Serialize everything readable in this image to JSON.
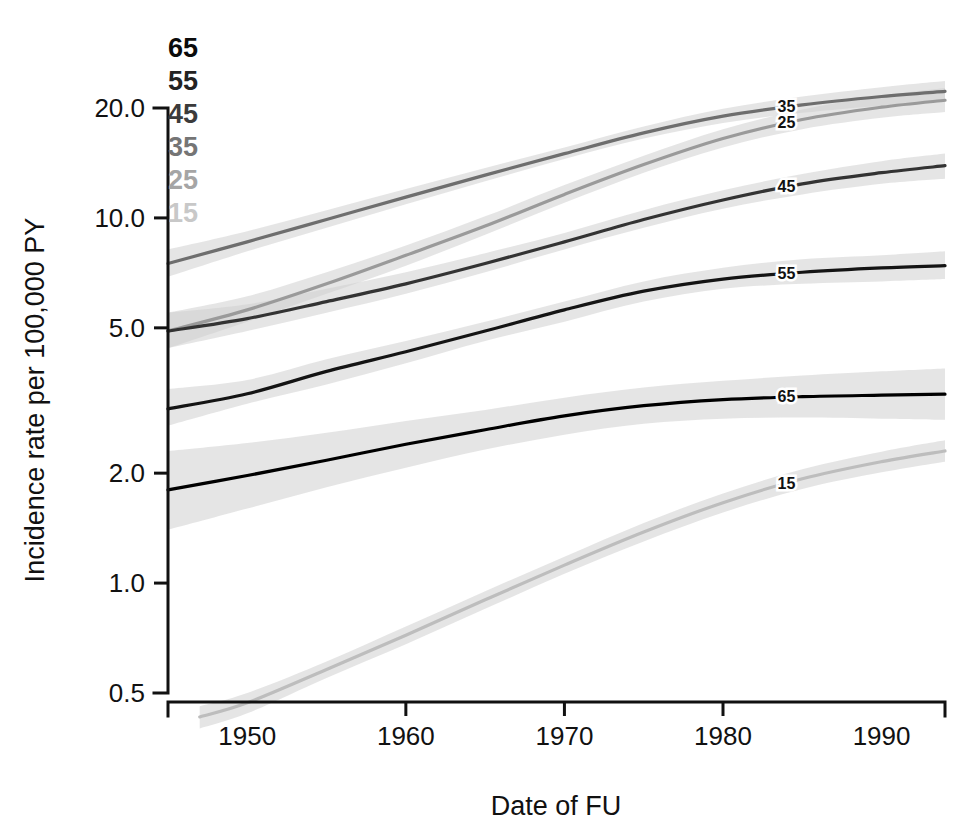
{
  "chart_data": {
    "type": "line",
    "title": "",
    "xlabel": "Date of FU",
    "ylabel": "Incidence rate per 100,000 PY",
    "yscale": "log",
    "xlim": [
      1945,
      1994
    ],
    "ylim": [
      0.45,
      24.0
    ],
    "grid": false,
    "legend_position": "top-left-inside",
    "xticks": [
      1950,
      1960,
      1970,
      1980,
      1990
    ],
    "xtick_labels": [
      "1950",
      "1960",
      "1970",
      "1980",
      "1990"
    ],
    "yticks": [
      0.5,
      1.0,
      2.0,
      5.0,
      10.0,
      20.0
    ],
    "ytick_labels": [
      "0.5",
      "1.0",
      "2.0",
      "5.0",
      "10.0",
      "20.0"
    ],
    "legend_entries": [
      "65",
      "55",
      "45",
      "35",
      "25",
      "15"
    ],
    "series": [
      {
        "name": "35",
        "label": "35",
        "color": "#6e6e6e",
        "inline_label": "35",
        "x": [
          1945,
          1950,
          1955,
          1960,
          1965,
          1970,
          1975,
          1980,
          1985,
          1990,
          1994
        ],
        "values": [
          7.5,
          8.6,
          9.9,
          11.4,
          13.1,
          15.0,
          17.1,
          19.0,
          20.4,
          21.5,
          22.2
        ],
        "ci_lower": [
          6.9,
          8.1,
          9.4,
          10.9,
          12.6,
          14.5,
          16.5,
          18.2,
          19.4,
          20.3,
          20.8
        ],
        "ci_upper": [
          8.2,
          9.2,
          10.5,
          12.0,
          13.7,
          15.6,
          17.8,
          19.9,
          21.5,
          22.8,
          23.7
        ]
      },
      {
        "name": "25",
        "label": "25",
        "color": "#9a9a9a",
        "inline_label": "25",
        "x": [
          1945,
          1950,
          1955,
          1960,
          1965,
          1970,
          1975,
          1980,
          1985,
          1990,
          1994
        ],
        "values": [
          4.9,
          5.6,
          6.6,
          7.9,
          9.5,
          11.6,
          14.0,
          16.5,
          18.6,
          20.1,
          21.0
        ],
        "ci_lower": [
          4.4,
          5.2,
          6.2,
          7.4,
          9.0,
          11.0,
          13.3,
          15.6,
          17.5,
          18.8,
          19.5
        ],
        "ci_upper": [
          5.5,
          6.1,
          7.1,
          8.4,
          10.1,
          12.3,
          14.8,
          17.5,
          19.8,
          21.6,
          22.7
        ]
      },
      {
        "name": "45",
        "label": "45",
        "color": "#333333",
        "inline_label": "45",
        "x": [
          1945,
          1950,
          1955,
          1960,
          1965,
          1970,
          1975,
          1980,
          1985,
          1990,
          1994
        ],
        "values": [
          4.9,
          5.3,
          5.9,
          6.6,
          7.5,
          8.6,
          9.9,
          11.2,
          12.4,
          13.3,
          13.9
        ],
        "ci_lower": [
          4.4,
          4.9,
          5.5,
          6.2,
          7.1,
          8.2,
          9.4,
          10.6,
          11.6,
          12.4,
          12.8
        ],
        "ci_upper": [
          5.5,
          5.8,
          6.4,
          7.1,
          8.0,
          9.1,
          10.5,
          11.9,
          13.2,
          14.3,
          15.0
        ]
      },
      {
        "name": "55",
        "label": "55",
        "color": "#141414",
        "inline_label": "55",
        "x": [
          1945,
          1950,
          1955,
          1960,
          1965,
          1970,
          1975,
          1980,
          1985,
          1990,
          1994
        ],
        "values": [
          3.0,
          3.3,
          3.8,
          4.3,
          4.9,
          5.6,
          6.3,
          6.8,
          7.1,
          7.3,
          7.4
        ],
        "ci_lower": [
          2.7,
          3.1,
          3.5,
          4.0,
          4.6,
          5.2,
          5.9,
          6.4,
          6.6,
          6.7,
          6.8
        ],
        "ci_upper": [
          3.4,
          3.6,
          4.1,
          4.6,
          5.2,
          5.9,
          6.7,
          7.3,
          7.7,
          7.9,
          8.1
        ]
      },
      {
        "name": "65",
        "label": "65",
        "color": "#000000",
        "inline_label": "65",
        "x": [
          1945,
          1950,
          1955,
          1960,
          1965,
          1970,
          1975,
          1980,
          1985,
          1990,
          1994
        ],
        "values": [
          1.8,
          1.97,
          2.17,
          2.4,
          2.63,
          2.87,
          3.06,
          3.18,
          3.24,
          3.27,
          3.29
        ],
        "ci_lower": [
          1.4,
          1.6,
          1.83,
          2.07,
          2.32,
          2.55,
          2.73,
          2.82,
          2.84,
          2.82,
          2.8
        ],
        "ci_upper": [
          2.3,
          2.42,
          2.58,
          2.78,
          2.98,
          3.22,
          3.43,
          3.58,
          3.7,
          3.8,
          3.87
        ]
      },
      {
        "name": "15",
        "label": "15",
        "color": "#bdbdbd",
        "inline_label": "15",
        "x": [
          1947,
          1950,
          1955,
          1960,
          1965,
          1970,
          1975,
          1980,
          1985,
          1990,
          1994
        ],
        "values": [
          0.43,
          0.47,
          0.58,
          0.72,
          0.9,
          1.12,
          1.38,
          1.66,
          1.93,
          2.15,
          2.3
        ],
        "ci_lower": [
          0.4,
          0.44,
          0.55,
          0.68,
          0.85,
          1.06,
          1.3,
          1.56,
          1.81,
          2.01,
          2.15
        ],
        "ci_upper": [
          0.46,
          0.5,
          0.61,
          0.76,
          0.95,
          1.18,
          1.46,
          1.76,
          2.05,
          2.29,
          2.46
        ]
      }
    ]
  },
  "axes": {
    "y_title": "Incidence rate per 100,000 PY",
    "x_title": "Date of FU"
  },
  "legend": {
    "items": [
      {
        "label": "65",
        "color": "#0b0b0b"
      },
      {
        "label": "55",
        "color": "#232323"
      },
      {
        "label": "45",
        "color": "#3b3b3b"
      },
      {
        "label": "35",
        "color": "#757575"
      },
      {
        "label": "25",
        "color": "#a5a5a5"
      },
      {
        "label": "15",
        "color": "#c8c8c8"
      }
    ]
  },
  "colors": {
    "axis": "#111111",
    "band": "#cfcfcf",
    "background": "#ffffff"
  }
}
